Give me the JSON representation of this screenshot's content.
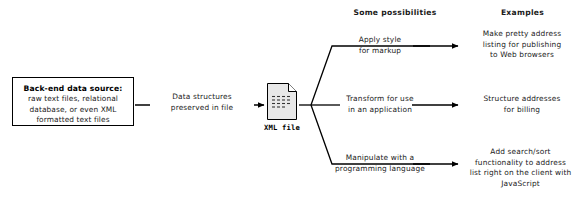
{
  "diagram": {
    "headers": {
      "possibilities": "Some possibilities",
      "examples": "Examples"
    },
    "source_box": {
      "title": "Back-end data source:",
      "body": "raw text files, relational\ndatabase, or even XML\nformatted text files"
    },
    "flow_label": "Data structures\npreserved in file",
    "file_node": {
      "label": "XML file",
      "icon": "xml-file-icon"
    },
    "branches": [
      {
        "action": "Apply style\nfor markup",
        "example": "Make pretty address\nlisting for publishing\nto Web browsers"
      },
      {
        "action": "Transform for use\nin an application",
        "example": "Structure addresses\nfor billing"
      },
      {
        "action": "Manipulate with a\nprogramming language",
        "example": "Add search/sort\nfunctionality to address\nlist right on the client with\nJavaScript"
      }
    ],
    "colors": {
      "line": "#000000",
      "text": "#1a1a1a",
      "icon_fill": "#e8e8e8",
      "background": "#ffffff"
    }
  }
}
